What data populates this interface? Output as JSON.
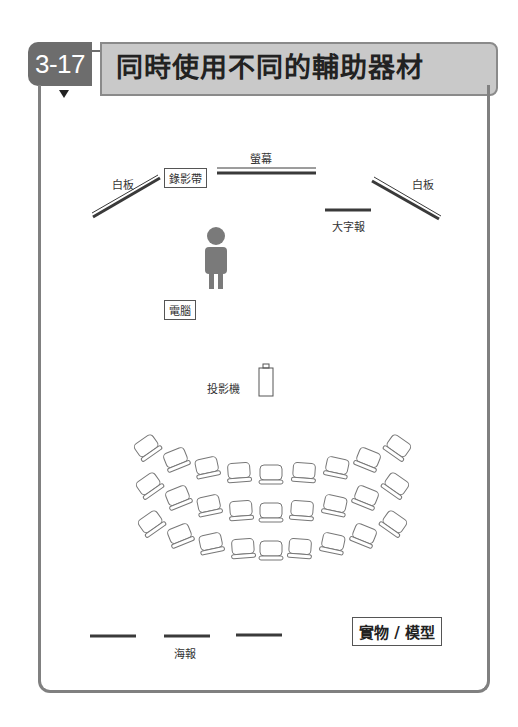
{
  "header": {
    "section_number": "3-17",
    "title": "同時使用不同的輔助器材"
  },
  "colors": {
    "badge": "#6d6d6d",
    "title_bg": "#c9c9c9",
    "frame": "#808080",
    "equipment_line": "#3a3a3a",
    "person": "#7a7a7a"
  },
  "diagram": {
    "whiteboard_left_label": "白板",
    "whiteboard_right_label": "白板",
    "videotape_label": "錄影帶",
    "screen_label": "螢幕",
    "big_poster_label": "大字報",
    "computer_label": "電腦",
    "projector_label": "投影機",
    "poster_label": "海報",
    "real_object_label": "實物 / 模型",
    "seating": {
      "rows": 3,
      "seats_per_row": 9
    }
  }
}
